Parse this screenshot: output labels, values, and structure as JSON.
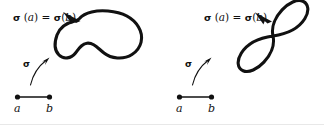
{
  "figure": {
    "background_color": "#ffffff",
    "ink_color": "#111111",
    "width": 324,
    "height": 125
  },
  "panels": [
    {
      "id": "simple-closed-curve",
      "curve_kind": "simple closed curve (bean / kidney shape)",
      "equation_label": {
        "sigma_1": "σ",
        "open_1": " (",
        "arg_1": "a",
        "close_1": ")",
        "equals": "=",
        "sigma_2": "σ",
        "open_2": "(",
        "arg_2": "b",
        "close_2": ")"
      },
      "map_label": "σ",
      "domain": {
        "left_endpoint_label": "a",
        "right_endpoint_label": "b"
      }
    },
    {
      "id": "figure-eight-curve",
      "curve_kind": "non-simple closed curve (figure eight, self-intersecting)",
      "equation_label": {
        "sigma_1": "σ",
        "open_1": " (",
        "arg_1": "a",
        "close_1": ")",
        "equals": "=",
        "sigma_2": "σ",
        "open_2": "(",
        "arg_2": "b",
        "close_2": ")"
      },
      "map_label": "σ",
      "domain": {
        "left_endpoint_label": "a",
        "right_endpoint_label": "b"
      }
    }
  ]
}
